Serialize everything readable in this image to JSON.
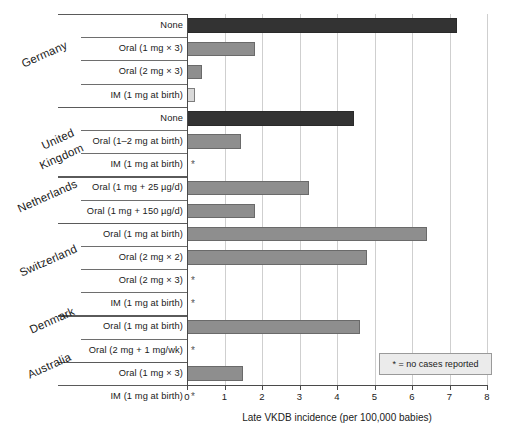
{
  "chart_data": {
    "type": "bar",
    "orientation": "horizontal",
    "title": "",
    "xlabel": "Late VKDB incidence (per 100,000 babies)",
    "ylabel": "",
    "xlim": [
      0,
      8
    ],
    "xticks": [
      "0",
      "1",
      "2",
      "3",
      "4",
      "5",
      "6",
      "7",
      "8"
    ],
    "grid": true,
    "legend": {
      "position": "bottom-right",
      "text": "* = no cases reported"
    },
    "no_data_marker": "*",
    "groups": [
      {
        "country": "Germany",
        "rows": [
          {
            "label": "None",
            "value": 7.2,
            "style": "none",
            "no_cases": false
          },
          {
            "label": "Oral (1 mg × 3)",
            "value": 1.8,
            "style": "oral",
            "no_cases": false
          },
          {
            "label": "Oral (2 mg × 3)",
            "value": 0.4,
            "style": "oral",
            "no_cases": false
          },
          {
            "label": "IM (1 mg at birth)",
            "value": 0.2,
            "style": "im",
            "no_cases": false
          }
        ]
      },
      {
        "country": "United Kingdom",
        "rows": [
          {
            "label": "None",
            "value": 4.45,
            "style": "none",
            "no_cases": false
          },
          {
            "label": "Oral (1–2 mg at birth)",
            "value": 1.45,
            "style": "oral",
            "no_cases": false
          },
          {
            "label": "IM (1 mg at birth)",
            "value": 0,
            "style": "oral",
            "no_cases": true
          }
        ]
      },
      {
        "country": "Netherlands",
        "rows": [
          {
            "label": "Oral (1 mg + 25 µg/d)",
            "value": 3.25,
            "style": "oral",
            "no_cases": false
          },
          {
            "label": "Oral (1 mg + 150 µg/d)",
            "value": 1.8,
            "style": "oral",
            "no_cases": false
          }
        ]
      },
      {
        "country": "Switzerland",
        "rows": [
          {
            "label": "Oral (1 mg at birth)",
            "value": 6.4,
            "style": "oral",
            "no_cases": false
          },
          {
            "label": "Oral (2 mg × 2)",
            "value": 4.8,
            "style": "oral",
            "no_cases": false
          },
          {
            "label": "Oral (2 mg × 3)",
            "value": 0,
            "style": "oral",
            "no_cases": true
          },
          {
            "label": "IM (1 mg at birth)",
            "value": 0,
            "style": "oral",
            "no_cases": true
          }
        ]
      },
      {
        "country": "Denmark",
        "rows": [
          {
            "label": "Oral (1 mg at birth)",
            "value": 4.6,
            "style": "oral",
            "no_cases": false
          },
          {
            "label": "Oral (2 mg + 1 mg/wk)",
            "value": 0,
            "style": "oral",
            "no_cases": true
          }
        ]
      },
      {
        "country": "Australia",
        "rows": [
          {
            "label": "Oral (1 mg × 3)",
            "value": 1.5,
            "style": "oral",
            "no_cases": false
          },
          {
            "label": "IM (1 mg at birth)",
            "value": 0,
            "style": "oral",
            "no_cases": true
          }
        ]
      }
    ]
  },
  "countries_layout": [
    {
      "name": "Germany",
      "left": 22,
      "top": 58
    },
    {
      "name": "United",
      "left": 42,
      "top": 140
    },
    {
      "name": "Kingdom",
      "left": 40,
      "top": 160
    },
    {
      "name": "Netherlands",
      "left": 18,
      "top": 203
    },
    {
      "name": "Switzerland",
      "left": 20,
      "top": 267
    },
    {
      "name": "Denmark",
      "left": 30,
      "top": 324
    },
    {
      "name": "Australia",
      "left": 28,
      "top": 369
    }
  ]
}
